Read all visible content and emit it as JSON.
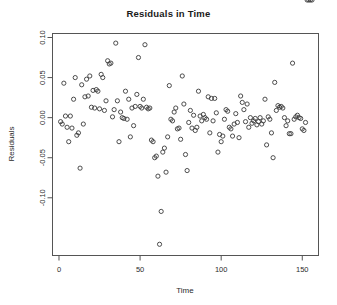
{
  "chart_data": {
    "type": "scatter",
    "title": "Residuals in Time",
    "xlabel": "Time",
    "ylabel": "Residuals",
    "xlim": [
      -4,
      160
    ],
    "ylim": [
      -0.172,
      0.105
    ],
    "grid": false,
    "legend": null,
    "xticks": [
      0,
      50,
      100,
      150
    ],
    "xtick_labels": [
      "0",
      "50",
      "100",
      "150"
    ],
    "yticks": [
      0.1,
      0.05,
      0.0,
      -0.05,
      -0.1
    ],
    "ytick_labels": [
      "0.10",
      "0.05",
      "0.00",
      "-0.05",
      "-0.10"
    ],
    "marker": "open-circle",
    "marker_color": "#3a3a3a",
    "point_count": 156,
    "x": [
      1,
      2,
      3,
      4,
      5,
      6,
      7,
      8,
      9,
      10,
      11,
      12,
      13,
      14,
      15,
      16,
      17,
      18,
      19,
      20,
      21,
      22,
      23,
      24,
      25,
      26,
      27,
      28,
      29,
      30,
      31,
      32,
      33,
      34,
      35,
      36,
      37,
      38,
      39,
      40,
      41,
      42,
      43,
      44,
      45,
      46,
      47,
      48,
      49,
      50,
      51,
      52,
      53,
      54,
      55,
      56,
      57,
      58,
      59,
      60,
      61,
      62,
      63,
      64,
      65,
      66,
      67,
      68,
      69,
      70,
      71,
      72,
      73,
      74,
      75,
      76,
      77,
      78,
      79,
      80,
      81,
      82,
      83,
      84,
      85,
      86,
      87,
      88,
      89,
      90,
      91,
      92,
      93,
      94,
      95,
      96,
      97,
      98,
      99,
      100,
      101,
      102,
      103,
      104,
      105,
      106,
      107,
      108,
      109,
      110,
      111,
      112,
      113,
      114,
      115,
      116,
      117,
      118,
      119,
      120,
      121,
      122,
      123,
      124,
      125,
      126,
      127,
      128,
      129,
      130,
      131,
      132,
      133,
      134,
      135,
      136,
      137,
      138,
      139,
      140,
      141,
      142,
      143,
      144,
      145,
      146,
      147,
      148,
      149,
      150,
      151,
      152,
      153,
      154,
      155,
      156
    ],
    "y": [
      -0.005,
      -0.008,
      0.043,
      0.002,
      -0.012,
      -0.03,
      0.002,
      -0.013,
      0.023,
      0.05,
      -0.022,
      -0.019,
      -0.063,
      0.041,
      -0.008,
      0.026,
      0.048,
      0.027,
      0.052,
      0.013,
      0.034,
      0.012,
      0.035,
      0.033,
      0.011,
      0.054,
      0.05,
      0.009,
      0.021,
      0.071,
      0.067,
      0.068,
      0.001,
      0.01,
      0.093,
      0.021,
      -0.03,
      0.007,
      0.0,
      -0.001,
      0.033,
      -0.002,
      0.023,
      -0.024,
      0.012,
      -0.01,
      0.014,
      0.029,
      0.075,
      0.014,
      0.012,
      0.023,
      0.091,
      0.013,
      0.011,
      0.012,
      -0.028,
      -0.03,
      -0.05,
      -0.048,
      -0.073,
      -0.158,
      -0.117,
      -0.043,
      -0.038,
      -0.068,
      -0.024,
      0.04,
      -0.002,
      -0.004,
      0.007,
      0.012,
      -0.014,
      -0.013,
      -0.027,
      0.052,
      0.017,
      -0.046,
      -0.066,
      -0.006,
      0.009,
      -0.013,
      0.003,
      -0.016,
      -0.012,
      0.033,
      0.002,
      -0.004,
      0.004,
      0.0,
      -0.002,
      0.026,
      -0.019,
      0.024,
      -0.004,
      0.024,
      0.006,
      -0.043,
      -0.021,
      -0.03,
      -0.023,
      -0.002,
      0.01,
      0.008,
      -0.012,
      -0.014,
      -0.023,
      -0.008,
      0.005,
      -0.006,
      -0.025,
      0.027,
      0.019,
      0.01,
      -0.005,
      0.017,
      -0.012,
      0.0,
      -0.007,
      -0.004,
      -0.001,
      -0.009,
      -0.005,
      0.0,
      -0.008,
      -0.004,
      0.023,
      -0.034,
      0.001,
      -0.002,
      -0.019,
      -0.05,
      0.044,
      0.009,
      0.015,
      0.013,
      0.014,
      0.012,
      0.0,
      -0.01,
      -0.004,
      -0.02,
      -0.02,
      0.068,
      -0.002,
      0.001,
      0.003,
      0.0,
      -0.001,
      -0.014,
      -0.016,
      -0.006
    ]
  }
}
